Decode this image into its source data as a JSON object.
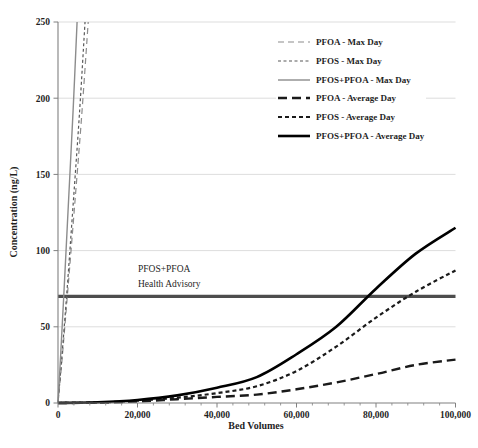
{
  "chart_data": {
    "type": "line",
    "title": "",
    "xlabel": "Bed Volumes",
    "ylabel": "Concentration (ng/L)",
    "xlim": [
      0,
      100000
    ],
    "ylim": [
      0,
      250
    ],
    "x_ticks": [
      0,
      20000,
      40000,
      60000,
      80000,
      100000
    ],
    "x_tick_labels": [
      "0",
      "20,000",
      "40,000",
      "60,000",
      "80,000",
      "100,000"
    ],
    "x_minor_tick_step": 4000,
    "y_ticks": [
      0,
      50,
      100,
      150,
      200,
      250
    ],
    "y_tick_labels": [
      "0",
      "50",
      "100",
      "150",
      "200",
      "250"
    ],
    "grid": "horizontal-only",
    "legend_position": "top-right-inside",
    "series": [
      {
        "name": "PFOA - Max Day",
        "color": "#8c8c8c",
        "width": 1.2,
        "dash": "6,4",
        "points": [
          [
            0,
            0
          ],
          [
            1000,
            28
          ],
          [
            2500,
            75
          ],
          [
            4200,
            130
          ],
          [
            6000,
            190
          ],
          [
            7600,
            250
          ]
        ]
      },
      {
        "name": "PFOS - Max Day",
        "color": "#595959",
        "width": 1.2,
        "dash": "3,2.5",
        "points": [
          [
            0,
            0
          ],
          [
            900,
            28
          ],
          [
            2300,
            75
          ],
          [
            3800,
            130
          ],
          [
            5400,
            190
          ],
          [
            6800,
            250
          ]
        ]
      },
      {
        "name": "PFOS+PFOA - Max Day",
        "color": "#8c8c8c",
        "width": 1.4,
        "dash": "",
        "points": [
          [
            0,
            0
          ],
          [
            600,
            28
          ],
          [
            1600,
            78
          ],
          [
            2700,
            135
          ],
          [
            3800,
            192
          ],
          [
            4800,
            250
          ]
        ]
      },
      {
        "name": "PFOA - Average Day",
        "color": "#1a1a1a",
        "width": 2.4,
        "dash": "9,5",
        "points": [
          [
            0,
            0
          ],
          [
            10000,
            0.2
          ],
          [
            20000,
            1
          ],
          [
            30000,
            2.5
          ],
          [
            40000,
            4
          ],
          [
            50000,
            5.5
          ],
          [
            60000,
            9
          ],
          [
            70000,
            13.5
          ],
          [
            80000,
            19
          ],
          [
            90000,
            25
          ],
          [
            100000,
            28.5
          ]
        ]
      },
      {
        "name": "PFOS - Average Day",
        "color": "#1a1a1a",
        "width": 2.2,
        "dash": "4,3",
        "points": [
          [
            0,
            0
          ],
          [
            10000,
            0.3
          ],
          [
            20000,
            1.5
          ],
          [
            30000,
            3.5
          ],
          [
            40000,
            6.5
          ],
          [
            50000,
            11
          ],
          [
            60000,
            21
          ],
          [
            70000,
            37
          ],
          [
            80000,
            56
          ],
          [
            90000,
            73
          ],
          [
            100000,
            87
          ]
        ]
      },
      {
        "name": "PFOS+PFOA - Average Day",
        "color": "#000000",
        "width": 2.6,
        "dash": "",
        "points": [
          [
            0,
            0
          ],
          [
            10000,
            0.5
          ],
          [
            20000,
            2
          ],
          [
            30000,
            5
          ],
          [
            40000,
            10
          ],
          [
            50000,
            17
          ],
          [
            60000,
            32
          ],
          [
            70000,
            50
          ],
          [
            80000,
            75
          ],
          [
            90000,
            98
          ],
          [
            100000,
            115
          ]
        ]
      }
    ],
    "reference_line": {
      "value": 70,
      "color": "#4d4d4d",
      "width": 3.2,
      "label_line1": "PFOS+PFOA",
      "label_line2": "Health Advisory"
    }
  },
  "colors": {
    "background": "#ffffff",
    "grid": "#d9d9d9",
    "axis": "#808080",
    "text": "#1f1f1f"
  }
}
